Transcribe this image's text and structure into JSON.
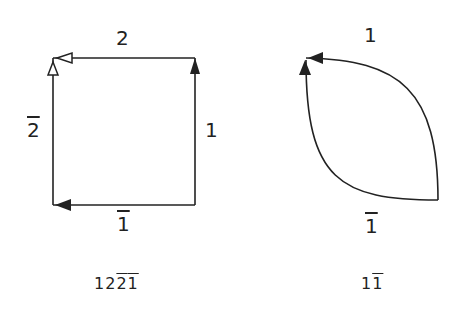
{
  "figures": [
    {
      "name": "square-loop",
      "edges": [
        {
          "id": "top",
          "label": "2",
          "barred": false,
          "arrow": "open"
        },
        {
          "id": "left",
          "label": "2",
          "barred": true,
          "arrow": "open"
        },
        {
          "id": "right",
          "label": "1",
          "barred": false,
          "arrow": "filled"
        },
        {
          "id": "bottom",
          "label": "1",
          "barred": true,
          "arrow": "filled"
        }
      ],
      "word": [
        {
          "ch": "1",
          "barred": false
        },
        {
          "ch": "2",
          "barred": false
        },
        {
          "ch": "2",
          "barred": true
        },
        {
          "ch": "1",
          "barred": true
        }
      ]
    },
    {
      "name": "lens-loop",
      "edges": [
        {
          "id": "top",
          "label": "1",
          "barred": false,
          "arrow": "filled"
        },
        {
          "id": "bottom",
          "label": "1",
          "barred": true,
          "arrow": "filled"
        }
      ],
      "word": [
        {
          "ch": "1",
          "barred": false
        },
        {
          "ch": "1",
          "barred": true
        }
      ]
    }
  ],
  "colors": {
    "stroke": "#222222",
    "background": "#ffffff"
  }
}
